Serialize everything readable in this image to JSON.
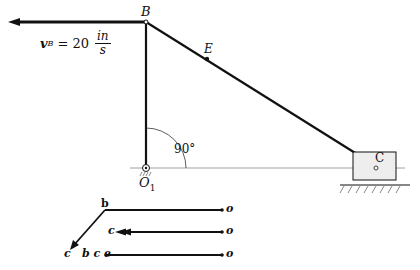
{
  "mechanism": {
    "point_b_label": "B",
    "point_e_label": "E",
    "point_c_label": "C",
    "pivot_label": "O",
    "pivot_subscript": "1",
    "angle_label": "90°",
    "velocity": {
      "symbol": "v",
      "subscript": "B",
      "equals": "= 20",
      "unit_num": "in",
      "unit_den": "s"
    }
  },
  "polygons": {
    "p1": {
      "b": "b",
      "c": "c",
      "o": "o"
    },
    "p2": {
      "c": "c",
      "o": "o"
    },
    "p3": {
      "bce": "b c e",
      "o": "o"
    }
  },
  "colors": {
    "ink": "#111111",
    "ground": "#888888",
    "slider": "#eeeeee"
  }
}
